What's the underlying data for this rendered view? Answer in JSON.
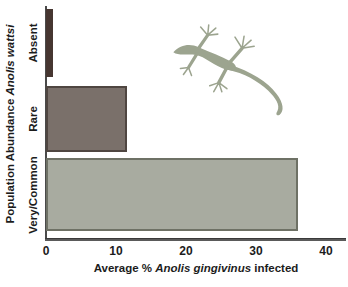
{
  "figure": {
    "background": "#ffffff",
    "y_axis_title": {
      "prefix": "Population Abundance ",
      "italic": "Anolis wattsi"
    },
    "x_axis_title": {
      "prefix": "Average % ",
      "italic": "Anolis gingivinus",
      "suffix": " infected"
    },
    "lizard_icon": "anole-lizard-silhouette",
    "lizard_color": "#9ca48f"
  },
  "chart_data": {
    "type": "bar",
    "orientation": "horizontal",
    "title": "",
    "categories": [
      "Absent",
      "Rare",
      "Very/Common"
    ],
    "values": [
      1,
      11.5,
      36
    ],
    "xlabel": "Average % Anolis gingivinus infected",
    "ylabel": "Population Abundance Anolis wattsi",
    "xlim": [
      0,
      43
    ],
    "xticks": [
      0,
      10,
      20,
      30,
      40
    ],
    "grid": false,
    "legend": false,
    "bar_colors": [
      "#463631",
      "#7a706a",
      "#a8aba0"
    ],
    "bar_border_colors": [
      "#463631",
      "#4f4641",
      "#6e7165"
    ],
    "axis_color": "#3a3a3a",
    "text_color": "#1c1c1c"
  }
}
